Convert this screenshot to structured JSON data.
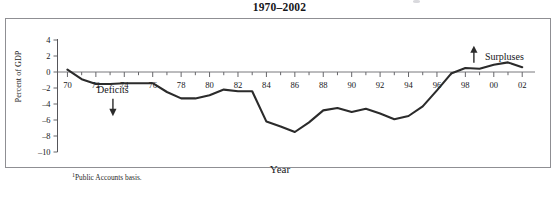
{
  "figure": {
    "title": "1970–2002",
    "footnote_marker": "1",
    "footnote_text": "Public Accounts basis.",
    "frame_color": "#8f8f93",
    "line_color": "#2b2b2b"
  },
  "chart_data": {
    "type": "line",
    "title": "1970–2002",
    "xlabel": "Year",
    "ylabel": "Percent of GDP",
    "xlim": [
      1969.3,
      2002.9
    ],
    "ylim": [
      -10,
      4
    ],
    "yticks": [
      4,
      2,
      0,
      -2,
      -4,
      -6,
      -8,
      -10
    ],
    "ytick_labels": [
      "4",
      "2",
      "0",
      "–2",
      "–4",
      "–6",
      "–8",
      "–10"
    ],
    "xticks": [
      1970,
      1972,
      1974,
      1976,
      1978,
      1980,
      1982,
      1984,
      1986,
      1988,
      1990,
      1992,
      1994,
      1996,
      1998,
      2000,
      2002
    ],
    "xtick_labels": [
      "70",
      "72",
      "74",
      "76",
      "78",
      "80",
      "82",
      "84",
      "86",
      "88",
      "90",
      "92",
      "94",
      "96",
      "98",
      "00",
      "02"
    ],
    "grid": false,
    "legend": null,
    "zero_reference_line": 0,
    "x": [
      1970,
      1971,
      1972,
      1973,
      1974,
      1975,
      1976,
      1977,
      1978,
      1979,
      1980,
      1981,
      1982,
      1983,
      1984,
      1985,
      1986,
      1987,
      1988,
      1989,
      1990,
      1991,
      1992,
      1993,
      1994,
      1995,
      1996,
      1997,
      1998,
      1999,
      2000,
      2001,
      2002
    ],
    "values": [
      0.3,
      -0.9,
      -1.5,
      -1.5,
      -1.4,
      -1.4,
      -1.4,
      -2.5,
      -3.3,
      -3.3,
      -2.9,
      -2.2,
      -2.4,
      -2.4,
      -6.2,
      -6.8,
      -7.5,
      -6.3,
      -4.8,
      -4.5,
      -5.0,
      -4.6,
      -5.2,
      -5.9,
      -5.5,
      -4.3,
      -2.3,
      -0.2,
      0.5,
      0.4,
      0.9,
      1.2,
      0.6
    ],
    "series_name": "Federal budget balance",
    "annotations": [
      {
        "text": "Deficits",
        "x": 1973.2,
        "y": -2.6,
        "arrow": "down"
      },
      {
        "text": "Surpluses",
        "x": 1998.6,
        "y": 2.9,
        "arrow": "up"
      }
    ]
  },
  "axis": {
    "y_title": "Percent of GDP",
    "x_title": "Year"
  },
  "annotations": {
    "deficits_label": "Deficits",
    "surpluses_label": "Surpluses"
  }
}
